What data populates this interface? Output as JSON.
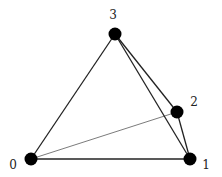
{
  "diagram": {
    "type": "graph",
    "colors": {
      "node": "#000000",
      "edge": "#222222",
      "background": "#ffffff"
    },
    "nodes": [
      {
        "id": "0",
        "label": "0",
        "x": 31,
        "y": 159,
        "label_x": 13,
        "label_y": 165
      },
      {
        "id": "1",
        "label": "1",
        "x": 190,
        "y": 159,
        "label_x": 206,
        "label_y": 165
      },
      {
        "id": "2",
        "label": "2",
        "x": 177,
        "y": 112,
        "label_x": 194,
        "label_y": 102
      },
      {
        "id": "3",
        "label": "3",
        "x": 115,
        "y": 34,
        "label_x": 113,
        "label_y": 15
      }
    ],
    "edges": [
      {
        "from": "0",
        "to": "3",
        "weight": "thick"
      },
      {
        "from": "0",
        "to": "1",
        "weight": "thick"
      },
      {
        "from": "0",
        "to": "2",
        "weight": "thin"
      },
      {
        "from": "3",
        "to": "1",
        "weight": "thick"
      },
      {
        "from": "3",
        "to": "2",
        "weight": "thick"
      },
      {
        "from": "2",
        "to": "1",
        "weight": "thick"
      }
    ]
  }
}
